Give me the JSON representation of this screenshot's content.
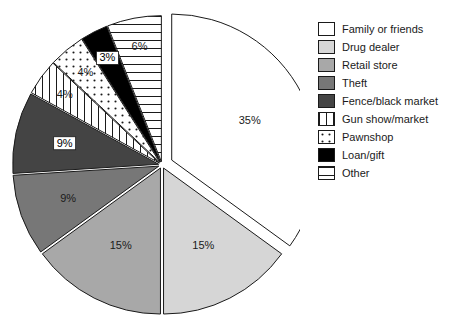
{
  "chart_data": {
    "type": "pie",
    "title": "",
    "xlabel": "",
    "ylabel": "",
    "legend_position": "right",
    "grid": false,
    "exploded": true,
    "start_angle_deg": 0,
    "direction": "clockwise",
    "categories": [
      "Family or friends",
      "Drug dealer",
      "Retail store",
      "Theft",
      "Fence/black market",
      "Gun show/market",
      "Pawnshop",
      "Loan/gift",
      "Other"
    ],
    "values": [
      35,
      15,
      15,
      9,
      9,
      4,
      4,
      3,
      6
    ],
    "value_labels": [
      "35%",
      "15%",
      "15%",
      "9%",
      "9%",
      "4%",
      "4%",
      "3%",
      "6%"
    ],
    "slice_styles": [
      {
        "name": "Family or friends",
        "fill": "#ffffff",
        "pattern": "solid",
        "label_style": "plain"
      },
      {
        "name": "Drug dealer",
        "fill": "#d6d6d6",
        "pattern": "solid",
        "label_style": "plain"
      },
      {
        "name": "Retail store",
        "fill": "#a8a8a8",
        "pattern": "solid",
        "label_style": "plain"
      },
      {
        "name": "Theft",
        "fill": "#777777",
        "pattern": "solid",
        "label_style": "plain"
      },
      {
        "name": "Fence/black market",
        "fill": "#444444",
        "pattern": "solid",
        "label_style": "boxed"
      },
      {
        "name": "Gun show/market",
        "fill": "#ffffff",
        "pattern": "vertical",
        "label_style": "plain"
      },
      {
        "name": "Pawnshop",
        "fill": "#ffffff",
        "pattern": "dots",
        "label_style": "plain"
      },
      {
        "name": "Loan/gift",
        "fill": "#000000",
        "pattern": "solid",
        "label_style": "boxed"
      },
      {
        "name": "Other",
        "fill": "#ffffff",
        "pattern": "horizontal",
        "label_style": "plain"
      }
    ],
    "colors": {
      "outline": "#1a1a1a",
      "background": "#ffffff",
      "text": "#1a1a1a"
    }
  },
  "legend": {
    "items": [
      {
        "label": "Family or friends"
      },
      {
        "label": "Drug dealer"
      },
      {
        "label": "Retail store"
      },
      {
        "label": "Theft"
      },
      {
        "label": "Fence/black market"
      },
      {
        "label": "Gun show/market"
      },
      {
        "label": "Pawnshop"
      },
      {
        "label": "Loan/gift"
      },
      {
        "label": "Other"
      }
    ]
  }
}
